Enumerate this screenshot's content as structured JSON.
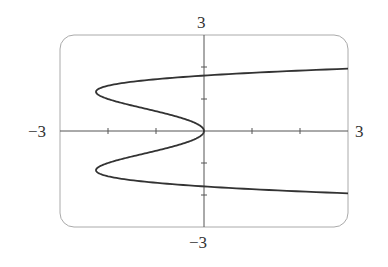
{
  "chart_data": {
    "type": "line",
    "title": "",
    "equation": "x = y^4 - 3y^2",
    "xlabel": "",
    "ylabel": "",
    "xlim": [
      -3,
      3
    ],
    "ylim": [
      -3,
      3
    ],
    "x_tick_step": 1,
    "y_tick_step": 1,
    "grid": false,
    "legend": null,
    "labels": {
      "x_min": "−3",
      "x_max": "3",
      "y_min": "−3",
      "y_max": "3"
    },
    "series": [
      {
        "name": "curve",
        "points": [
          {
            "y": -1.95,
            "x": 3.0
          },
          {
            "y": -1.73,
            "x": 0.0
          },
          {
            "y": -1.5,
            "x": -1.69
          },
          {
            "y": -1.22,
            "x": -2.25
          },
          {
            "y": -1.0,
            "x": -2.0
          },
          {
            "y": -0.5,
            "x": -0.69
          },
          {
            "y": 0.0,
            "x": 0.0
          },
          {
            "y": 0.5,
            "x": -0.69
          },
          {
            "y": 1.0,
            "x": -2.0
          },
          {
            "y": 1.22,
            "x": -2.25
          },
          {
            "y": 1.5,
            "x": -1.69
          },
          {
            "y": 1.73,
            "x": 0.0
          },
          {
            "y": 1.95,
            "x": 3.0
          }
        ]
      }
    ]
  },
  "colors": {
    "curve": "#333333",
    "axes": "#555555",
    "frame": "#aaaaaa"
  }
}
